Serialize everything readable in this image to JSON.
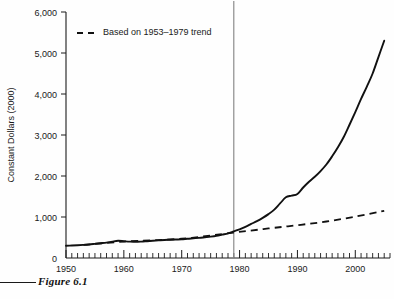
{
  "figure": {
    "caption": "Figure 6.1"
  },
  "chart_data": {
    "type": "line",
    "title": "",
    "xlabel": "",
    "ylabel": "Constant Dollars (2000)",
    "xlim": [
      1950,
      2006
    ],
    "ylim": [
      0,
      6000
    ],
    "grid": false,
    "legend_position": "top-left",
    "y_ticks": [
      0,
      1000,
      2000,
      3000,
      4000,
      5000,
      6000
    ],
    "y_tick_labels": [
      "0",
      "1,000",
      "2,000",
      "3,000",
      "4,000",
      "5,000",
      "6,000"
    ],
    "x_ticks": [
      1950,
      1960,
      1970,
      1980,
      1990,
      2000
    ],
    "x_tick_labels": [
      "1950",
      "1960",
      "1970",
      "1980",
      "1990",
      "2000"
    ],
    "x_minor_tick_interval": 1,
    "annotations": [
      {
        "name": "reference-line-1979",
        "type": "vline",
        "x": 1979,
        "color": "#8c8c8c"
      }
    ],
    "series": [
      {
        "name": "Actual constant dollars",
        "style": "solid",
        "color": "#111111",
        "x": [
          1950,
          1951,
          1952,
          1953,
          1954,
          1955,
          1956,
          1957,
          1958,
          1959,
          1960,
          1961,
          1962,
          1963,
          1964,
          1965,
          1966,
          1967,
          1968,
          1969,
          1970,
          1971,
          1972,
          1973,
          1974,
          1975,
          1976,
          1977,
          1978,
          1979,
          1980,
          1981,
          1982,
          1983,
          1984,
          1985,
          1986,
          1987,
          1988,
          1989,
          1990,
          1991,
          1992,
          1993,
          1994,
          1995,
          1996,
          1997,
          1998,
          1999,
          2000,
          2001,
          2002,
          2003,
          2004,
          2005
        ],
        "values": [
          300,
          305,
          312,
          320,
          330,
          345,
          360,
          375,
          400,
          420,
          410,
          400,
          395,
          400,
          410,
          420,
          430,
          440,
          445,
          450,
          455,
          470,
          480,
          490,
          505,
          520,
          540,
          570,
          600,
          650,
          700,
          760,
          830,
          900,
          980,
          1070,
          1180,
          1330,
          1480,
          1520,
          1560,
          1720,
          1860,
          1980,
          2120,
          2280,
          2480,
          2700,
          2950,
          3250,
          3560,
          3880,
          4180,
          4500,
          4900,
          5300
        ]
      },
      {
        "name": "Based on 1953–1979 trend",
        "style": "dashed",
        "color": "#111111",
        "x": [
          1953,
          1960,
          1970,
          1979,
          1985,
          1990,
          1995,
          2000,
          2005
        ],
        "values": [
          320,
          400,
          470,
          620,
          720,
          800,
          890,
          1010,
          1150
        ]
      }
    ],
    "legend": [
      {
        "label": "Based on 1953–1979 trend",
        "style": "dashed"
      }
    ]
  }
}
